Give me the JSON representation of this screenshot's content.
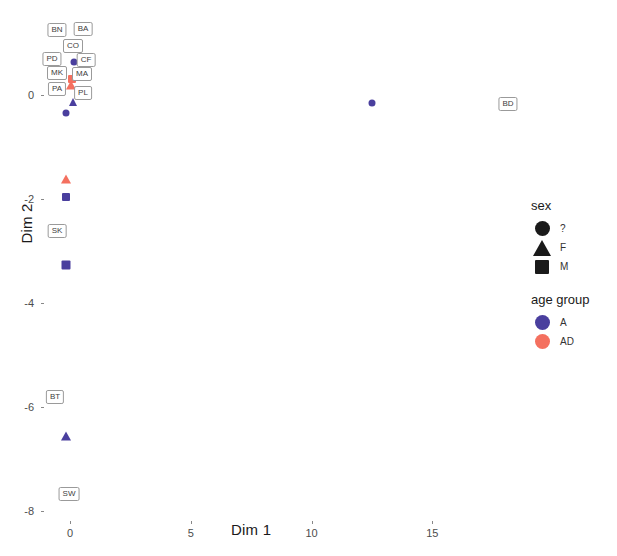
{
  "chart_data": {
    "type": "scatter",
    "title": "",
    "xlabel": "Dim 1",
    "ylabel": "Dim 2",
    "xlim": [
      -1.3,
      17.8
    ],
    "ylim": [
      -8.6,
      0.9
    ],
    "xticks": [
      0,
      5,
      10,
      15
    ],
    "yticks": [
      0,
      -2,
      -4,
      -6,
      -8
    ],
    "xtick_labels": [
      "0",
      "5",
      "10",
      "15"
    ],
    "ytick_labels": [
      "0",
      "-2",
      "-4",
      "-6",
      "-8"
    ],
    "grid": false,
    "legend_position": "right",
    "series": [
      {
        "name": "A",
        "color": "#4a3f9e",
        "points": [
          {
            "label": "BA",
            "sex": "?",
            "x": 0.17,
            "y": 0.33,
            "px": 74,
            "py": 62
          },
          {
            "label": "CF",
            "sex": "?",
            "x": 0.17,
            "y": 0.33,
            "px": 74,
            "py": 62
          },
          {
            "label": "PL",
            "sex": "F",
            "x": 0.13,
            "y": -0.15,
            "px": 73,
            "py": 102
          },
          {
            "label": "PA",
            "sex": "?",
            "x": 0.13,
            "y": -0.4,
            "px": 73,
            "py": 113
          },
          {
            "label": "BD",
            "sex": "?",
            "x": 12.5,
            "y": -0.16,
            "px": 372,
            "py": 103
          },
          {
            "label": "SK",
            "sex": "M",
            "x": 0.13,
            "y": -1.82,
            "px": 73,
            "py": 197
          },
          {
            "label": "",
            "sex": "M",
            "x": 0.13,
            "y": -3.28,
            "px": 66,
            "py": 265
          },
          {
            "label": "BT",
            "sex": "F",
            "x": 0.28,
            "y": -6.63,
            "px": 66,
            "py": 436
          },
          {
            "label": "SW",
            "sex": "M",
            "x": 0.2,
            "y": -8.1,
            "px": 68,
            "py": 520
          }
        ]
      },
      {
        "name": "AD",
        "color": "#f4705f",
        "points": [
          {
            "label": "MA",
            "sex": "?",
            "x": 0.17,
            "y": -0.05,
            "px": 72,
            "py": 79
          },
          {
            "label": "MK",
            "sex": "F",
            "x": 0.15,
            "y": -0.1,
            "px": 71,
            "py": 84
          },
          {
            "label": "",
            "sex": "F",
            "x": 0.13,
            "y": -1.62,
            "px": 66,
            "py": 179
          }
        ]
      }
    ],
    "point_labels": [
      {
        "text": "BN",
        "px": 57,
        "py": 30
      },
      {
        "text": "BA",
        "px": 83,
        "py": 29
      },
      {
        "text": "CO",
        "px": 73,
        "py": 46
      },
      {
        "text": "PD",
        "px": 52,
        "py": 59
      },
      {
        "text": "CF",
        "px": 86,
        "py": 60
      },
      {
        "text": "MK",
        "px": 57,
        "py": 73
      },
      {
        "text": "MA",
        "px": 82,
        "py": 74
      },
      {
        "text": "PA",
        "px": 57,
        "py": 89
      },
      {
        "text": "PL",
        "px": 83,
        "py": 93
      },
      {
        "text": "BD",
        "px": 508,
        "py": 104
      },
      {
        "text": "SK",
        "px": 57,
        "py": 231
      },
      {
        "text": "BT",
        "px": 55,
        "py": 397
      },
      {
        "text": "SW",
        "px": 69,
        "py": 494
      }
    ],
    "markers": [
      {
        "shape": "circle",
        "color": "#4a3f9e",
        "size": 7,
        "px": 74,
        "py": 62
      },
      {
        "shape": "square",
        "color": "#f4705f",
        "size": 8,
        "px": 72,
        "py": 79
      },
      {
        "shape": "triangle",
        "color": "#f4705f",
        "size": 9,
        "px": 71,
        "py": 85
      },
      {
        "shape": "triangle",
        "color": "#4a3f9e",
        "size": 8,
        "px": 73,
        "py": 102
      },
      {
        "shape": "circle",
        "color": "#4a3f9e",
        "size": 7,
        "px": 66,
        "py": 113
      },
      {
        "shape": "circle",
        "color": "#4a3f9e",
        "size": 7,
        "px": 372,
        "py": 103
      },
      {
        "shape": "triangle",
        "color": "#f4705f",
        "size": 9,
        "px": 66,
        "py": 179
      },
      {
        "shape": "square",
        "color": "#4a3f9e",
        "size": 8,
        "px": 66,
        "py": 197
      },
      {
        "shape": "square",
        "color": "#4a3f9e",
        "size": 9,
        "px": 66,
        "py": 265
      },
      {
        "shape": "triangle",
        "color": "#4a3f9e",
        "size": 9,
        "px": 66,
        "py": 436
      }
    ]
  },
  "legend": {
    "sex": {
      "title": "sex",
      "entries": [
        {
          "label": "?",
          "shape": "circle",
          "color": "#1a1a1a"
        },
        {
          "label": "F",
          "shape": "triangle",
          "color": "#1a1a1a"
        },
        {
          "label": "M",
          "shape": "square",
          "color": "#1a1a1a"
        }
      ]
    },
    "age_group": {
      "title": "age group",
      "entries": [
        {
          "label": "A",
          "shape": "circle",
          "color": "#4a3f9e"
        },
        {
          "label": "AD",
          "shape": "circle",
          "color": "#f4705f"
        }
      ]
    }
  }
}
